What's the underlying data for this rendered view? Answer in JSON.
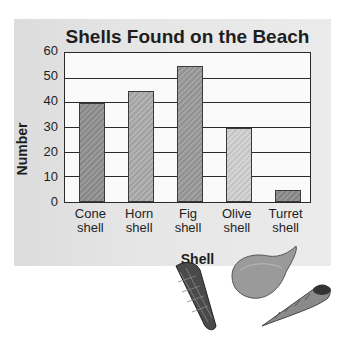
{
  "chart_data": {
    "type": "bar",
    "title": "Shells Found on the Beach",
    "xlabel": "Shell",
    "ylabel": "Number",
    "categories": [
      "Cone shell",
      "Horn shell",
      "Fig shell",
      "Olive shell",
      "Turret shell"
    ],
    "category_lines": [
      [
        "Cone",
        "shell"
      ],
      [
        "Horn",
        "shell"
      ],
      [
        "Fig",
        "shell"
      ],
      [
        "Olive",
        "shell"
      ],
      [
        "Turret",
        "shell"
      ]
    ],
    "values": [
      40,
      45,
      55,
      30,
      5
    ],
    "ylim": [
      0,
      60
    ],
    "yticks": [
      "0",
      "10",
      "20",
      "30",
      "40",
      "50",
      "60"
    ],
    "grid": true,
    "legend": null,
    "bar_colors": [
      "#8e8e8e",
      "#aaaaaa",
      "#999999",
      "#cfcfcf",
      "#8a8a8a"
    ]
  },
  "decorations": [
    "cone-shell-illustration",
    "fig-shell-illustration",
    "turret-shell-illustration"
  ]
}
